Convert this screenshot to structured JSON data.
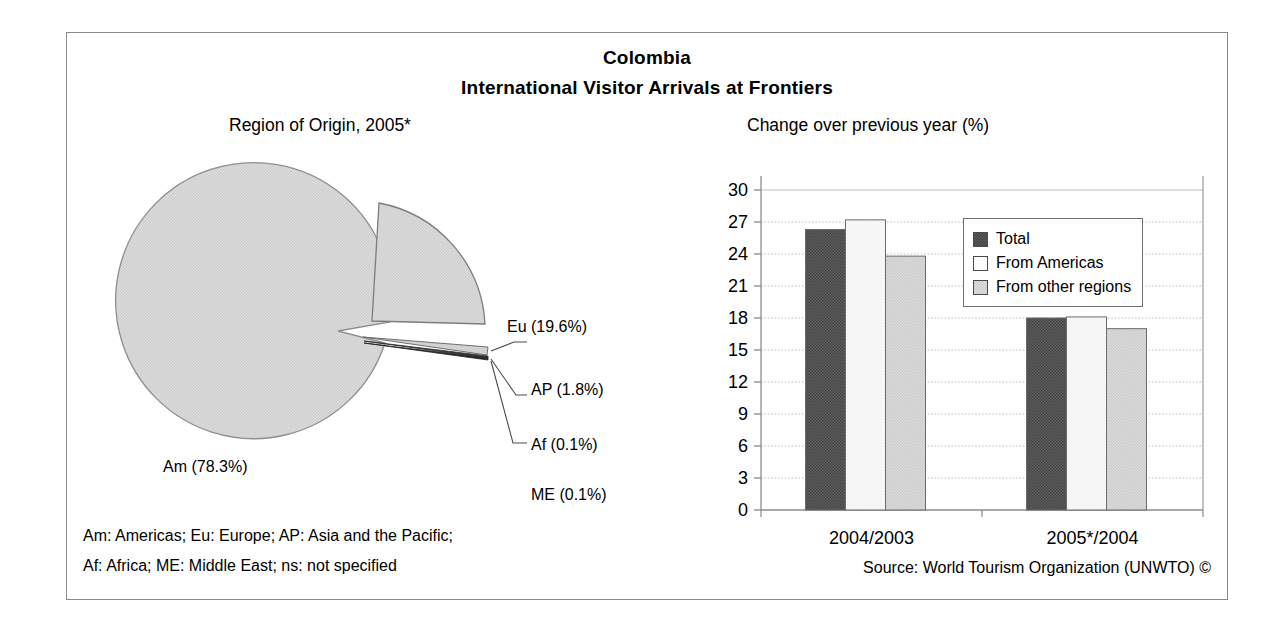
{
  "figure": {
    "title": "Colombia",
    "subtitle": "International Visitor Arrivals at Frontiers",
    "source": "Source: World Tourism Organization (UNWTO) ©",
    "notes": [
      "Am: Americas; Eu: Europe; AP: Asia and the Pacific;",
      "Af: Africa; ME: Middle East; ns: not specified"
    ],
    "border_color": "#8a8a8a"
  },
  "colors": {
    "total": "#5a5a5a",
    "from_americas": "#fbfbfb",
    "from_other_regions": "#dcdcdc",
    "pie_slice": "#d9d9d9",
    "outline": "#4a4a4a",
    "gridline": "#b4b4b4"
  },
  "pie_panel": {
    "title": "Region of Origin, 2005*",
    "labels": {
      "am": "Am (78.3%)",
      "eu": "Eu (19.6%)",
      "ap": "AP (1.8%)",
      "af": "Af (0.1%)",
      "me": "ME (0.1%)"
    }
  },
  "bar_panel": {
    "title": "Change over previous year (%)",
    "legend": [
      {
        "label": "Total",
        "swatch": "total"
      },
      {
        "label": "From Americas",
        "swatch": "from_americas"
      },
      {
        "label": "From other regions",
        "swatch": "from_other_regions"
      }
    ],
    "y_ticks": [
      "0",
      "3",
      "6",
      "9",
      "12",
      "15",
      "18",
      "21",
      "24",
      "27",
      "30"
    ],
    "x_labels": [
      "2004/2003",
      "2005*/2004"
    ]
  },
  "chart_data": [
    {
      "type": "pie",
      "title": "Region of Origin, 2005*",
      "labels": [
        "Am",
        "Eu",
        "AP",
        "Af",
        "ME"
      ],
      "label_texts": [
        "Am (78.3%)",
        "Eu (19.6%)",
        "AP (1.8%)",
        "Af (0.1%)",
        "ME (0.1%)"
      ],
      "values": [
        78.3,
        19.6,
        1.8,
        0.1,
        0.1
      ],
      "unit": "%",
      "exploded": [
        "Eu",
        "AP",
        "Af",
        "ME"
      ],
      "legend": "labels on slices with leader lines"
    },
    {
      "type": "bar",
      "title": "Change over previous year (%)",
      "categories": [
        "2004/2003",
        "2005*/2004"
      ],
      "series": [
        {
          "name": "Total",
          "values": [
            26.3,
            18.0
          ]
        },
        {
          "name": "From Americas",
          "values": [
            27.2,
            18.1
          ]
        },
        {
          "name": "From other regions",
          "values": [
            23.8,
            17.0
          ]
        }
      ],
      "xlabel": "",
      "ylabel": "",
      "ylim": [
        0,
        30
      ],
      "ytick_step": 3,
      "grid": true,
      "legend_position": "top-right-inside"
    }
  ]
}
